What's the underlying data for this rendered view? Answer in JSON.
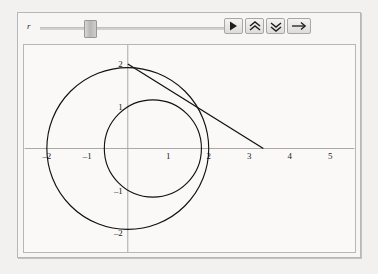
{
  "panel": {
    "title": "",
    "accent_color": "#111111",
    "panel_bg": "#f7f6f5",
    "plot_bg": "#faf9f8",
    "border_color": "#b9b7b5"
  },
  "controls": {
    "slider": {
      "label": "r",
      "value_fraction": 0.24,
      "min": 0,
      "max": 1
    },
    "buttons": [
      {
        "name": "play-button",
        "icon": "play-icon",
        "label": "▶"
      },
      {
        "name": "step-up-button",
        "icon": "double-chevron-up-icon",
        "label": "⌃⌃"
      },
      {
        "name": "step-down-button",
        "icon": "double-chevron-down-icon",
        "label": "⌄⌄"
      },
      {
        "name": "direction-button",
        "icon": "right-arrow-icon",
        "label": "→"
      }
    ]
  },
  "chart_data": {
    "type": "line",
    "title": "",
    "xlabel": "",
    "ylabel": "",
    "xlim": [
      -2.55,
      5.6
    ],
    "ylim": [
      -2.45,
      2.45
    ],
    "grid": false,
    "legend": null,
    "xticks": [
      -2,
      -1,
      1,
      2,
      3,
      4,
      5
    ],
    "xtick_labels": [
      "-2",
      "-1",
      "1",
      "2",
      "3",
      "4",
      "5"
    ],
    "yticks": [
      2,
      1,
      -1,
      -2
    ],
    "ytick_labels": [
      "2",
      "1",
      "-1",
      "-2"
    ],
    "series": [
      {
        "name": "unit-circle-radius-2",
        "shape": "circle",
        "center": [
          0,
          0
        ],
        "radius": 2
      },
      {
        "name": "moving-circle",
        "shape": "circle",
        "center": [
          0.62,
          0
        ],
        "radius": 1.2
      },
      {
        "name": "tangent-line",
        "shape": "segment",
        "points": [
          [
            0,
            2
          ],
          [
            3.35,
            0
          ]
        ]
      }
    ],
    "annotations": [
      {
        "name": "tangency-point",
        "x": 1.2,
        "y": 1.06
      }
    ]
  }
}
